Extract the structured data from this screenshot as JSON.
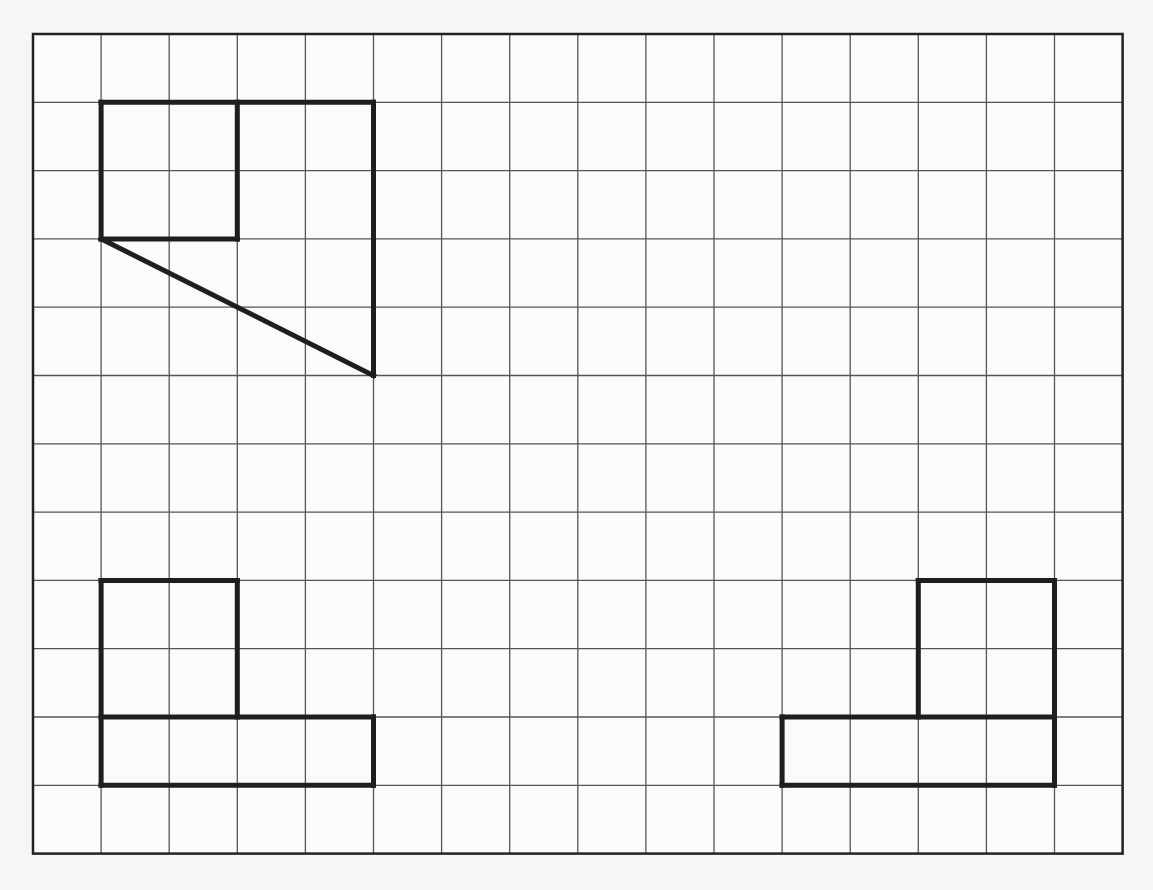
{
  "diagram": {
    "type": "grid-figures",
    "grid": {
      "columns": 16,
      "rows": 12,
      "origin_px": [
        33,
        34
      ],
      "cell_px": [
        68.1,
        68.3
      ],
      "line_color": "#555555",
      "border_color": "#222222",
      "background": "#fbfbfb"
    },
    "stroke_color": "#1e1e1e",
    "figures": [
      {
        "name": "figure-top-left",
        "description": "Square (2x2) attached to right trapezoid with diagonal edge",
        "segments": [
          [
            [
              1,
              1
            ],
            [
              5,
              1
            ]
          ],
          [
            [
              5,
              1
            ],
            [
              5,
              5
            ]
          ],
          [
            [
              5,
              5
            ],
            [
              1,
              3
            ]
          ],
          [
            [
              1,
              3
            ],
            [
              1,
              1
            ]
          ],
          [
            [
              3,
              1
            ],
            [
              3,
              3
            ]
          ],
          [
            [
              1,
              3
            ],
            [
              3,
              3
            ]
          ]
        ]
      },
      {
        "name": "figure-bottom-left",
        "description": "2x2 square on top of 4x1 rectangle (left-aligned)",
        "segments": [
          [
            [
              1,
              8
            ],
            [
              3,
              8
            ]
          ],
          [
            [
              3,
              8
            ],
            [
              3,
              10
            ]
          ],
          [
            [
              1,
              8
            ],
            [
              1,
              11
            ]
          ],
          [
            [
              1,
              10
            ],
            [
              5,
              10
            ]
          ],
          [
            [
              5,
              10
            ],
            [
              5,
              11
            ]
          ],
          [
            [
              1,
              11
            ],
            [
              5,
              11
            ]
          ]
        ]
      },
      {
        "name": "figure-bottom-right",
        "description": "2x2 square on top of 4x1 rectangle (right-aligned)",
        "segments": [
          [
            [
              13,
              8
            ],
            [
              15,
              8
            ]
          ],
          [
            [
              13,
              8
            ],
            [
              13,
              10
            ]
          ],
          [
            [
              15,
              8
            ],
            [
              15,
              11
            ]
          ],
          [
            [
              11,
              10
            ],
            [
              15,
              10
            ]
          ],
          [
            [
              11,
              10
            ],
            [
              11,
              11
            ]
          ],
          [
            [
              11,
              11
            ],
            [
              15,
              11
            ]
          ]
        ]
      }
    ]
  }
}
